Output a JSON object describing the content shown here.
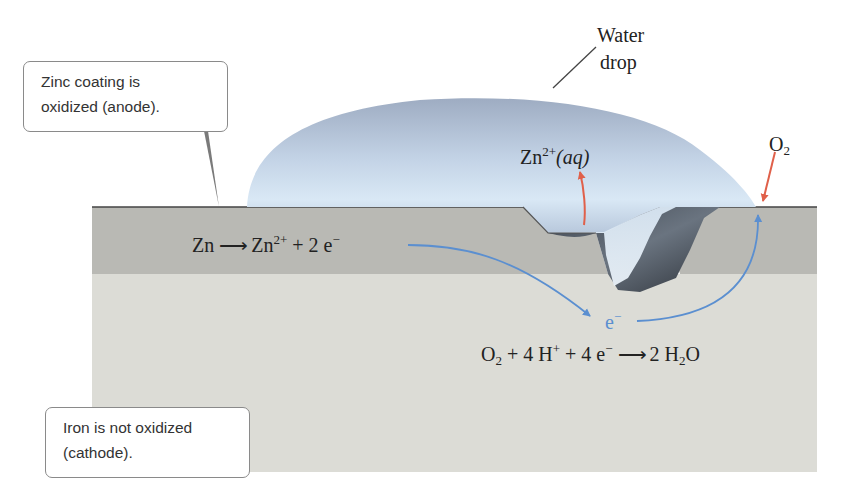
{
  "figure": {
    "colors": {
      "zinc_layer": "#b9b9b4",
      "iron_layer": "#dcdcd6",
      "water_drop": "#aebfd6",
      "electron_arrow": "#5b8fd0",
      "ion_arrow": "#e0604a",
      "callout_border": "#8a8a8a"
    }
  },
  "callouts": {
    "anode": {
      "line1": "Zinc coating is",
      "line2": "oxidized (anode)."
    },
    "cathode": {
      "line1": "Iron is not oxidized",
      "line2": "(cathode)."
    }
  },
  "labels": {
    "water_drop": {
      "line1": "Water",
      "line2": "drop"
    },
    "zn_ion": {
      "base": "Zn",
      "charge": "2+",
      "state": "(aq)"
    },
    "o2": {
      "base": "O",
      "sub": "2"
    },
    "electron": {
      "base": "e",
      "charge": "−"
    }
  },
  "equations": {
    "anode": {
      "reactant": "Zn",
      "arrow": "⟶",
      "product": "Zn",
      "product_charge": "2+",
      "plus": "+ 2 e",
      "electron_charge": "−"
    },
    "cathode": {
      "o": "O",
      "o_sub": "2",
      "part2": "+ 4 H",
      "h_charge": "+",
      "part3": "+ 4 e",
      "e_charge": "−",
      "arrow": "⟶",
      "product_pre": "2 H",
      "h_sub": "2",
      "product_post": "O"
    }
  }
}
